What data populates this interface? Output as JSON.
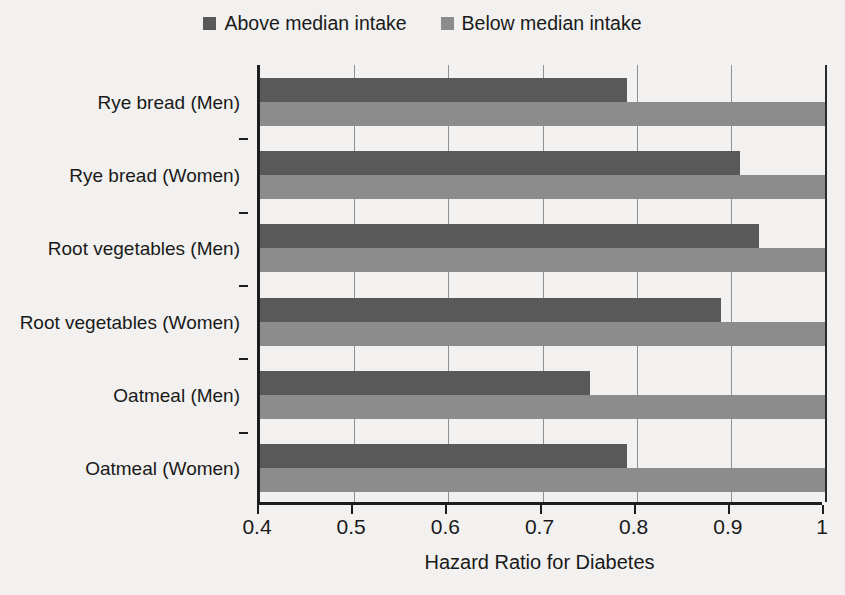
{
  "chart_data": {
    "type": "bar",
    "orientation": "horizontal",
    "title": "",
    "xlabel": "Hazard Ratio for Diabetes",
    "ylabel": "",
    "xlim": [
      0.4,
      1.0
    ],
    "xticks": [
      "0.4",
      "0.5",
      "0.6",
      "0.7",
      "0.8",
      "0.9",
      "1"
    ],
    "xtick_values": [
      0.4,
      0.5,
      0.6,
      0.7,
      0.8,
      0.9,
      1.0
    ],
    "grid": true,
    "grid_axis": "x",
    "legend_position": "top-center",
    "categories": [
      "Rye bread (Men)",
      "Rye bread (Women)",
      "Root vegetables (Men)",
      "Root vegetables (Women)",
      "Oatmeal (Men)",
      "Oatmeal (Women)"
    ],
    "series": [
      {
        "name": "Above median intake",
        "color": "#595959",
        "values": [
          0.79,
          0.91,
          0.93,
          0.89,
          0.75,
          0.79
        ]
      },
      {
        "name": "Below median intake",
        "color": "#8c8c8c",
        "values": [
          1.0,
          1.0,
          1.0,
          1.0,
          1.0,
          1.0
        ]
      }
    ]
  },
  "legend": {
    "entries": [
      {
        "label": "Above median intake",
        "color": "#595959",
        "icon": "square-swatch-icon"
      },
      {
        "label": "Below median intake",
        "color": "#8c8c8c",
        "icon": "square-swatch-icon"
      }
    ]
  },
  "axis": {
    "x_title": "Hazard Ratio for Diabetes"
  }
}
